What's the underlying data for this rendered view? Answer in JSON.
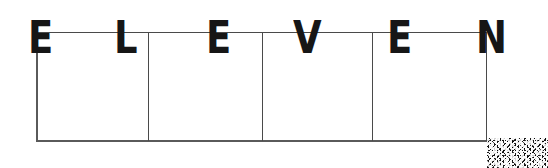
{
  "document": {
    "type": "scanned-form-fragment",
    "background_color": "#ffffff",
    "ink_color": "#161616",
    "rule_color": "#4a4a4a"
  },
  "heading": {
    "text": "ELEVEN",
    "letters": [
      {
        "char": "E",
        "x": 28,
        "y": 16
      },
      {
        "char": "L",
        "x": 114,
        "y": 16
      },
      {
        "char": "E",
        "x": 206,
        "y": 16
      },
      {
        "char": "V",
        "x": 293,
        "y": 16
      },
      {
        "char": "E",
        "x": 387,
        "y": 16
      },
      {
        "char": "N",
        "x": 476,
        "y": 16
      }
    ]
  },
  "table": {
    "columns": 4,
    "rows": 1,
    "column_headers": [
      "",
      "",
      "",
      ""
    ],
    "cells": [
      [
        "",
        "",
        "",
        ""
      ]
    ],
    "divider_positions": [
      112,
      226,
      336
    ]
  },
  "artifact": {
    "label": "scan-noise-block"
  }
}
